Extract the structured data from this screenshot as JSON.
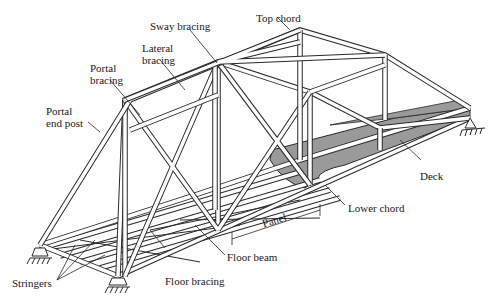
{
  "diagram": {
    "labels": {
      "top_chord": "Top chord",
      "sway_bracing": "Sway bracing",
      "lateral_bracing_1": "Lateral",
      "lateral_bracing_2": "bracing",
      "portal_bracing_1": "Portal",
      "portal_bracing_2": "bracing",
      "portal_end_post_1": "Portal",
      "portal_end_post_2": "end post",
      "deck": "Deck",
      "lower_chord": "Lower chord",
      "panel": "Panel",
      "floor_beam": "Floor beam",
      "floor_bracing": "Floor bracing",
      "stringers": "Stringers"
    },
    "colors": {
      "member_fill": "#ffffff",
      "member_stroke": "#2a2a2a",
      "deck_fill": "#9a9a9a",
      "text": "#1a1a1a"
    }
  }
}
